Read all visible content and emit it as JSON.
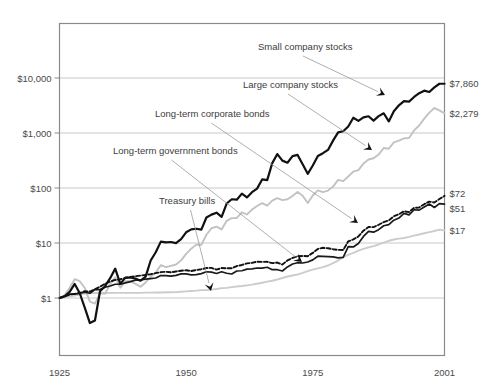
{
  "chart_data": {
    "type": "line",
    "title": "",
    "subtitle": "",
    "xlabel": "",
    "ylabel": "",
    "yscale": "log",
    "ylim": [
      0.1,
      40000
    ],
    "xlim": [
      1925,
      2001
    ],
    "grid": true,
    "legend_position": "inline-annotations",
    "x_ticks": [
      "1925",
      "1950",
      "1975",
      "2001"
    ],
    "x_tick_values": [
      1925,
      1950,
      1975,
      2001
    ],
    "y_ticks": [
      "$1",
      "$10",
      "$100",
      "$1,000",
      "$10,000"
    ],
    "y_tick_values": [
      1,
      10,
      100,
      1000,
      10000
    ],
    "end_labels": [
      {
        "text": "$7,860",
        "value": 7860,
        "series": "Small company stocks"
      },
      {
        "text": "$2,279",
        "value": 2279,
        "series": "Large company stocks"
      },
      {
        "text": "$72",
        "value": 72,
        "series": "Long-term corporate bonds"
      },
      {
        "text": "$51",
        "value": 51,
        "series": "Long-term government bonds"
      },
      {
        "text": "$17",
        "value": 17,
        "series": "Treasury bills"
      }
    ],
    "annotations": [
      {
        "label": "Small company stocks",
        "x": 258,
        "y": 50,
        "arrow_to": [
          385,
          95
        ]
      },
      {
        "label": "Large company stocks",
        "x": 243,
        "y": 88,
        "arrow_to": [
          372,
          150
        ]
      },
      {
        "label": "Long-term corporate bonds",
        "x": 155,
        "y": 117,
        "arrow_to": [
          358,
          223
        ]
      },
      {
        "label": "Long-term government bonds",
        "x": 113,
        "y": 154,
        "arrow_to": [
          302,
          262
        ]
      },
      {
        "label": "Treasury bills",
        "x": 159,
        "y": 204,
        "arrow_to": [
          211,
          291
        ]
      }
    ],
    "series": [
      {
        "name": "Small company stocks",
        "style": "thick-solid-black",
        "color": "#111111",
        "end_value": 7860,
        "x": [
          1925,
          1926,
          1927,
          1928,
          1929,
          1930,
          1931,
          1932,
          1933,
          1934,
          1935,
          1936,
          1937,
          1938,
          1939,
          1940,
          1941,
          1942,
          1943,
          1944,
          1945,
          1946,
          1947,
          1948,
          1949,
          1950,
          1951,
          1952,
          1953,
          1954,
          1955,
          1956,
          1957,
          1958,
          1959,
          1960,
          1961,
          1962,
          1963,
          1964,
          1965,
          1966,
          1967,
          1968,
          1969,
          1970,
          1971,
          1972,
          1973,
          1974,
          1975,
          1976,
          1977,
          1978,
          1979,
          1980,
          1981,
          1982,
          1983,
          1984,
          1985,
          1986,
          1987,
          1988,
          1989,
          1990,
          1991,
          1992,
          1993,
          1994,
          1995,
          1996,
          1997,
          1998,
          1999,
          2000,
          2001
        ],
        "values": [
          1.0,
          1.07,
          1.29,
          1.8,
          1.22,
          0.66,
          0.35,
          0.39,
          1.33,
          1.64,
          2.29,
          3.42,
          1.81,
          2.35,
          2.36,
          2.25,
          2.06,
          2.45,
          4.81,
          6.78,
          10.6,
          10.24,
          10.42,
          9.98,
          11.8,
          15.64,
          17.67,
          18.18,
          17.45,
          29.11,
          32.8,
          35.51,
          29.93,
          52.19,
          62.43,
          61.29,
          79.09,
          67.32,
          84.01,
          97.43,
          143.2,
          138.98,
          282.86,
          413.76,
          314.45,
          288.13,
          379.43,
          399.53,
          269.18,
          180.97,
          256.32,
          382.84,
          429.33,
          492.76,
          727.18,
          1027.6,
          1076.15,
          1311.35,
          1894.77,
          1664.09,
          1927.82,
          2014.85,
          1677.12,
          2024.0,
          2282.23,
          1625.4,
          2489.65,
          3190.27,
          3796.51,
          3727.23,
          4524.49,
          5305.65,
          5889.49,
          5571.67,
          6766.78,
          7860.0,
          7860.0
        ]
      },
      {
        "name": "Large company stocks",
        "style": "thin-solid-gray",
        "color": "#c2c2c2",
        "end_value": 2279,
        "x": [
          1925,
          1926,
          1927,
          1928,
          1929,
          1930,
          1931,
          1932,
          1933,
          1934,
          1935,
          1936,
          1937,
          1938,
          1939,
          1940,
          1941,
          1942,
          1943,
          1944,
          1945,
          1946,
          1947,
          1948,
          1949,
          1950,
          1951,
          1952,
          1953,
          1954,
          1955,
          1956,
          1957,
          1958,
          1959,
          1960,
          1961,
          1962,
          1963,
          1964,
          1965,
          1966,
          1967,
          1968,
          1969,
          1970,
          1971,
          1972,
          1973,
          1974,
          1975,
          1976,
          1977,
          1978,
          1979,
          1980,
          1981,
          1982,
          1983,
          1984,
          1985,
          1986,
          1987,
          1988,
          1989,
          1990,
          1991,
          1992,
          1993,
          1994,
          1995,
          1996,
          1997,
          1998,
          1999,
          2000,
          2001
        ],
        "values": [
          1.0,
          1.12,
          1.54,
          2.2,
          2.02,
          1.52,
          0.86,
          0.79,
          1.22,
          1.2,
          1.78,
          2.37,
          1.54,
          2.02,
          2.01,
          1.81,
          1.6,
          1.92,
          2.42,
          2.9,
          3.96,
          3.64,
          3.85,
          4.06,
          4.83,
          6.36,
          7.89,
          9.34,
          9.24,
          14.11,
          18.56,
          19.78,
          17.65,
          25.3,
          28.34,
          28.49,
          36.13,
          32.97,
          40.47,
          47.13,
          53.01,
          47.67,
          59.1,
          65.64,
          60.06,
          62.47,
          71.41,
          84.96,
          72.5,
          53.31,
          73.14,
          90.58,
          84.08,
          89.59,
          106.11,
          140.51,
          133.61,
          162.26,
          198.82,
          211.27,
          278.37,
          330.22,
          347.53,
          405.22,
          533.45,
          516.85,
          674.4,
          725.82,
          798.85,
          809.29,
          1113.92,
          1369.32,
          1826.0,
          2349.0,
          2842.0,
          2584.0,
          2279.0
        ]
      },
      {
        "name": "Long-term corporate bonds",
        "style": "dashed-black",
        "color": "#111111",
        "end_value": 72,
        "x": [
          1925,
          1926,
          1927,
          1928,
          1929,
          1930,
          1931,
          1932,
          1933,
          1934,
          1935,
          1936,
          1937,
          1938,
          1939,
          1940,
          1941,
          1942,
          1943,
          1944,
          1945,
          1946,
          1947,
          1948,
          1949,
          1950,
          1951,
          1952,
          1953,
          1954,
          1955,
          1956,
          1957,
          1958,
          1959,
          1960,
          1961,
          1962,
          1963,
          1964,
          1965,
          1966,
          1967,
          1968,
          1969,
          1970,
          1971,
          1972,
          1973,
          1974,
          1975,
          1976,
          1977,
          1978,
          1979,
          1980,
          1981,
          1982,
          1983,
          1984,
          1985,
          1986,
          1987,
          1988,
          1989,
          1990,
          1991,
          1992,
          1993,
          1994,
          1995,
          1996,
          1997,
          1998,
          1999,
          2000,
          2001
        ],
        "values": [
          1.0,
          1.07,
          1.15,
          1.19,
          1.23,
          1.33,
          1.31,
          1.45,
          1.6,
          1.82,
          1.99,
          2.13,
          2.19,
          2.32,
          2.41,
          2.49,
          2.56,
          2.63,
          2.7,
          2.83,
          2.95,
          3.0,
          2.93,
          3.04,
          3.13,
          3.2,
          3.09,
          3.22,
          3.33,
          3.51,
          3.53,
          3.28,
          3.51,
          3.47,
          3.48,
          3.81,
          3.99,
          4.26,
          4.36,
          4.57,
          4.54,
          4.55,
          4.3,
          4.41,
          4.05,
          4.82,
          5.35,
          5.74,
          5.82,
          5.76,
          6.61,
          7.81,
          8.18,
          8.03,
          7.71,
          7.49,
          7.45,
          10.73,
          11.61,
          13.14,
          16.73,
          19.6,
          19.4,
          21.48,
          24.01,
          25.7,
          30.5,
          33.3,
          37.8,
          36.4,
          43.6,
          44.3,
          50.8,
          56.6,
          54.5,
          62.9,
          72.0
        ]
      },
      {
        "name": "Long-term government bonds",
        "style": "thin-solid-black",
        "color": "#1a1a1a",
        "end_value": 51,
        "x": [
          1925,
          1926,
          1927,
          1928,
          1929,
          1930,
          1931,
          1932,
          1933,
          1934,
          1935,
          1936,
          1937,
          1938,
          1939,
          1940,
          1941,
          1942,
          1943,
          1944,
          1945,
          1946,
          1947,
          1948,
          1949,
          1950,
          1951,
          1952,
          1953,
          1954,
          1955,
          1956,
          1957,
          1958,
          1959,
          1960,
          1961,
          1962,
          1963,
          1964,
          1965,
          1966,
          1967,
          1968,
          1969,
          1970,
          1971,
          1972,
          1973,
          1974,
          1975,
          1976,
          1977,
          1978,
          1979,
          1980,
          1981,
          1982,
          1983,
          1984,
          1985,
          1986,
          1987,
          1988,
          1989,
          1990,
          1991,
          1992,
          1993,
          1994,
          1995,
          1996,
          1997,
          1998,
          1999,
          2000,
          2001
        ],
        "values": [
          1.0,
          1.08,
          1.18,
          1.18,
          1.22,
          1.28,
          1.22,
          1.42,
          1.42,
          1.57,
          1.65,
          1.78,
          1.78,
          1.88,
          1.99,
          2.11,
          2.13,
          2.2,
          2.25,
          2.31,
          2.56,
          2.56,
          2.49,
          2.58,
          2.75,
          2.75,
          2.64,
          2.67,
          2.77,
          3.0,
          2.96,
          2.79,
          3.0,
          2.82,
          2.73,
          3.1,
          3.13,
          3.35,
          3.39,
          3.51,
          3.49,
          3.62,
          3.27,
          3.27,
          3.1,
          3.67,
          4.15,
          4.38,
          4.33,
          4.52,
          4.93,
          5.75,
          5.73,
          5.67,
          5.6,
          5.38,
          5.47,
          8.58,
          8.48,
          9.82,
          13.15,
          16.26,
          15.75,
          17.48,
          20.58,
          21.51,
          26.0,
          28.4,
          34.5,
          32.4,
          40.2,
          39.6,
          45.2,
          51.2,
          44.2,
          52.0,
          51.0
        ]
      },
      {
        "name": "Treasury bills",
        "style": "thin-solid-lightgray",
        "color": "#cccccc",
        "end_value": 17,
        "x": [
          1925,
          1926,
          1927,
          1928,
          1929,
          1930,
          1931,
          1932,
          1933,
          1934,
          1935,
          1936,
          1937,
          1938,
          1939,
          1940,
          1941,
          1942,
          1943,
          1944,
          1945,
          1946,
          1947,
          1948,
          1949,
          1950,
          1951,
          1952,
          1953,
          1954,
          1955,
          1956,
          1957,
          1958,
          1959,
          1960,
          1961,
          1962,
          1963,
          1964,
          1965,
          1966,
          1967,
          1968,
          1969,
          1970,
          1971,
          1972,
          1973,
          1974,
          1975,
          1976,
          1977,
          1978,
          1979,
          1980,
          1981,
          1982,
          1983,
          1984,
          1985,
          1986,
          1987,
          1988,
          1989,
          1990,
          1991,
          1992,
          1993,
          1994,
          1995,
          1996,
          1997,
          1998,
          1999,
          2000,
          2001
        ],
        "values": [
          1.0,
          1.03,
          1.07,
          1.11,
          1.16,
          1.21,
          1.22,
          1.23,
          1.23,
          1.23,
          1.24,
          1.24,
          1.24,
          1.24,
          1.24,
          1.24,
          1.24,
          1.25,
          1.25,
          1.26,
          1.26,
          1.27,
          1.27,
          1.28,
          1.3,
          1.32,
          1.34,
          1.36,
          1.39,
          1.4,
          1.42,
          1.46,
          1.51,
          1.53,
          1.58,
          1.62,
          1.65,
          1.7,
          1.75,
          1.82,
          1.89,
          1.98,
          2.06,
          2.17,
          2.31,
          2.46,
          2.57,
          2.67,
          2.86,
          3.09,
          3.29,
          3.46,
          3.64,
          3.9,
          4.3,
          4.79,
          5.51,
          6.1,
          6.63,
          7.28,
          7.84,
          8.32,
          8.78,
          9.4,
          10.18,
          10.97,
          11.58,
          11.99,
          12.35,
          12.89,
          13.61,
          14.3,
          15.04,
          15.78,
          16.52,
          17.5,
          17.0
        ]
      }
    ]
  }
}
